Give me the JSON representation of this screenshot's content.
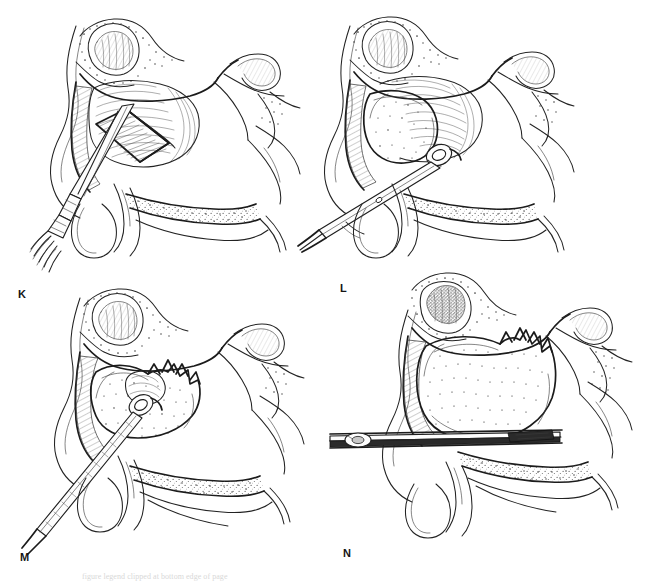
{
  "figure": {
    "style": "pen-and-ink medical line illustration, grayscale",
    "background_color": "#ffffff",
    "ink_color": "#232323",
    "layout": {
      "columns": 2,
      "rows": 2,
      "width": 646,
      "height": 581
    }
  },
  "caption": {
    "visible_text": "figure legend clipped at bottom edge of page",
    "clipped": true
  },
  "panels": [
    {
      "id": "K",
      "label": "K",
      "label_position": {
        "x": 18,
        "y": 289
      },
      "view": "sagittal section of nasal cavity and maxillary sinus",
      "depicts": "osteotome creating rectangular bone window in anterior maxillary sinus wall",
      "instrument": "osteotome-chisel",
      "instrument_held_by_hand": true,
      "lesion_shading": "light",
      "structures": [
        "frontal sinus",
        "nasal dorsum",
        "maxillary sinus",
        "bone window flap",
        "inferior turbinate",
        "middle turbinate",
        "hard palate",
        "sphenoid sinus",
        "soft palate"
      ]
    },
    {
      "id": "L",
      "label": "L",
      "label_position": {
        "x": 340,
        "y": 283
      },
      "view": "sagittal section of nasal cavity and maxillary sinus",
      "depicts": "ring curette introduced through antrostomy toward stippled lesion",
      "instrument": "ring-curette",
      "instrument_held_by_hand": false,
      "lesion_shading": "stippled dark",
      "structures": [
        "frontal sinus",
        "maxillary sinus",
        "stippled tumor mass",
        "inferior turbinate",
        "hard palate",
        "sphenoid sinus",
        "soft palate"
      ]
    },
    {
      "id": "M",
      "label": "M",
      "label_position": {
        "x": 20,
        "y": 557
      },
      "view": "sagittal section of nasal cavity and maxillary sinus",
      "depicts": "ring curette elevating and removing tumor mass from sinus cavity",
      "instrument": "ring-curette",
      "instrument_held_by_hand": false,
      "lesion_shading": "stippled dark with torn margin",
      "structures": [
        "frontal sinus",
        "maxillary sinus",
        "stippled tumor mass",
        "torn mucosal margin",
        "inferior turbinate",
        "hard palate",
        "sphenoid sinus"
      ]
    },
    {
      "id": "N",
      "label": "N",
      "label_position": {
        "x": 343,
        "y": 551
      },
      "view": "sagittal section of nasal cavity and maxillary sinus",
      "depicts": "rigid endoscope passed along nasal floor to inspect residual mass",
      "instrument": "rigid-endoscope",
      "instrument_held_by_hand": false,
      "lesion_shading": "dense dark stipple",
      "structures": [
        "frontal sinus",
        "maxillary sinus",
        "residual tumor mass",
        "inferior turbinate",
        "hard palate",
        "sphenoid sinus",
        "soft palate"
      ]
    }
  ]
}
